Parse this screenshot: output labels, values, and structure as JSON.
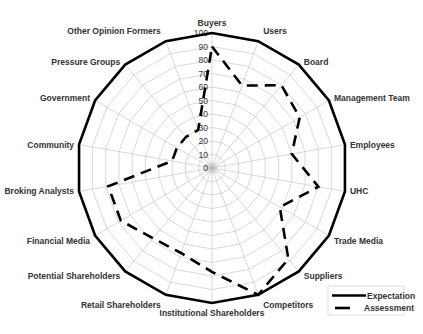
{
  "chart_data": {
    "type": "radar",
    "title": "",
    "categories": [
      "Buyers",
      "Users",
      "Board",
      "Management Team",
      "Employees",
      "UHC",
      "Trade Media",
      "Suppliers",
      "Competitors",
      "Institutional Shareholders",
      "Retail Shareholders",
      "Potential Shareholders",
      "Financial Media",
      "Broking Analysts",
      "Community",
      "Government",
      "Pressure Groups",
      "Other Opinion Formers"
    ],
    "series": [
      {
        "name": "Expectation",
        "style": "solid",
        "color": "#000000",
        "values": [
          100,
          100,
          100,
          100,
          100,
          100,
          100,
          100,
          100,
          100,
          100,
          100,
          100,
          100,
          100,
          100,
          100,
          100
        ]
      },
      {
        "name": "Assessment",
        "style": "dashed",
        "color": "#000000",
        "values": [
          90,
          65,
          80,
          75,
          60,
          80,
          58,
          88,
          100,
          77,
          67,
          68,
          78,
          78,
          30,
          30,
          30,
          30
        ]
      }
    ],
    "radial_axis": {
      "range": [
        0,
        100
      ],
      "ticks": [
        0,
        10,
        20,
        30,
        40,
        50,
        60,
        70,
        80,
        90,
        100
      ]
    },
    "grid": true,
    "legend_position": "bottom-right"
  },
  "legend": {
    "items": [
      {
        "label": "Expectation",
        "style": "solid"
      },
      {
        "label": "Assessment",
        "style": "dashed"
      }
    ]
  }
}
